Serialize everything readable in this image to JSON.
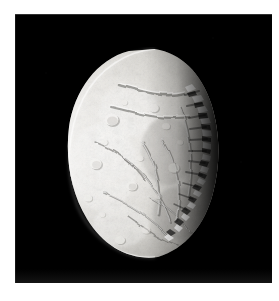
{
  "page": {
    "background_color": "#ffffff",
    "width": 279,
    "height": 301
  },
  "image_plate": {
    "name": "ariel-voyager-image",
    "background_color": "#000000",
    "border_color": "#000000",
    "x": 15,
    "y": 14,
    "width": 257,
    "height": 269
  },
  "subject": {
    "label": "Ariel",
    "type": "planetary-moon-photograph",
    "description": "Crescent-lit icy moon with heavily cratered terrain, intersecting fault canyons and grabens; jagged terminator along the right side.",
    "illuminated_side": "left",
    "terminator_side": "right",
    "surface_color_bright": "#f2f1ee",
    "surface_color_mid": "#b9b8b4",
    "surface_color_shadow": "#2a2a29",
    "limb_color": "#fbfbfa"
  },
  "caption": {
    "text": "",
    "color": "#dcdcdc",
    "visible": false
  }
}
